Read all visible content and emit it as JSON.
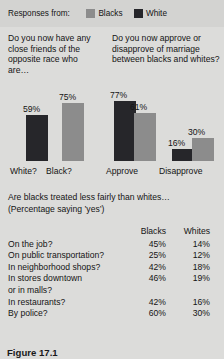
{
  "legend": {
    "title": "Responses from:",
    "items": [
      {
        "label": "Blacks",
        "color": "#8c8c8c",
        "swatch_name": "legend-swatch-blacks"
      },
      {
        "label": "White",
        "color": "#26262a",
        "swatch_name": "legend-swatch-white"
      }
    ]
  },
  "panels": {
    "friends": {
      "question": "Do you now have any close friends of the opposite race who are…",
      "bars": [
        {
          "label": "White?",
          "value": 59,
          "value_label": "59%",
          "color": "#26262a"
        },
        {
          "label": "Black?",
          "value": 75,
          "value_label": "75%",
          "color": "#8c8c8c"
        }
      ]
    },
    "marriage": {
      "question": "Do you now approve or disapprove of marriage between blacks and whites?",
      "groups": [
        {
          "label": "Approve",
          "bars": [
            {
              "value": 77,
              "value_label": "77%",
              "color": "#26262a",
              "series": "White"
            },
            {
              "value": 61,
              "value_label": "61%",
              "color": "#8c8c8c",
              "series": "Blacks"
            }
          ]
        },
        {
          "label": "Disapprove",
          "bars": [
            {
              "value": 16,
              "value_label": "16%",
              "color": "#26262a",
              "series": "White"
            },
            {
              "value": 30,
              "value_label": "30%",
              "color": "#8c8c8c",
              "series": "Blacks"
            }
          ]
        }
      ]
    }
  },
  "fairness": {
    "title": "Are blacks treated less fairly than whites…",
    "subtitle": "(Percentage saying ’yes’)",
    "columns": {
      "label": "",
      "blacks": "Blacks",
      "whites": "Whites"
    },
    "rows": [
      {
        "label": "On the job?",
        "label_line2": "",
        "blacks": "45%",
        "whites": "14%"
      },
      {
        "label": "On public transportation?",
        "label_line2": "",
        "blacks": "25%",
        "whites": "12%"
      },
      {
        "label": "In neighborhood shops?",
        "label_line2": "",
        "blacks": "42%",
        "whites": "18%"
      },
      {
        "label": "In stores downtown",
        "label_line2": "or in malls?",
        "blacks": "46%",
        "whites": "19%"
      },
      {
        "label": "In restaurants?",
        "label_line2": "",
        "blacks": "42%",
        "whites": "16%"
      },
      {
        "label": "By police?",
        "label_line2": "",
        "blacks": "60%",
        "whites": "30%"
      }
    ]
  },
  "caption": "Figure 17.1",
  "chart_data": [
    {
      "type": "bar",
      "title": "Do you now have any close friends of the opposite race who are…",
      "categories": [
        "White?",
        "Black?"
      ],
      "values": [
        59,
        75
      ],
      "value_labels": [
        "59%",
        "75%"
      ],
      "xlabel": "",
      "ylabel": "",
      "ylim": [
        0,
        100
      ],
      "grid": false,
      "legend_position": "top"
    },
    {
      "type": "bar",
      "title": "Do you now approve or disapprove of marriage between blacks and whites?",
      "categories": [
        "Approve",
        "Disapprove"
      ],
      "series": [
        {
          "name": "White",
          "values": [
            77,
            16
          ],
          "color": "#26262a"
        },
        {
          "name": "Blacks",
          "values": [
            61,
            30
          ],
          "color": "#8c8c8c"
        }
      ],
      "xlabel": "",
      "ylabel": "",
      "ylim": [
        0,
        100
      ],
      "grid": false,
      "legend_position": "top"
    },
    {
      "type": "table",
      "title": "Are blacks treated less fairly than whites… (Percentage saying ’yes’)",
      "columns": [
        "",
        "Blacks",
        "Whites"
      ],
      "rows": [
        [
          "On the job?",
          "45%",
          "14%"
        ],
        [
          "On public transportation?",
          "25%",
          "12%"
        ],
        [
          "In neighborhood shops?",
          "42%",
          "18%"
        ],
        [
          "In stores downtown or in malls?",
          "46%",
          "19%"
        ],
        [
          "In restaurants?",
          "42%",
          "16%"
        ],
        [
          "By police?",
          "60%",
          "30%"
        ]
      ]
    }
  ]
}
